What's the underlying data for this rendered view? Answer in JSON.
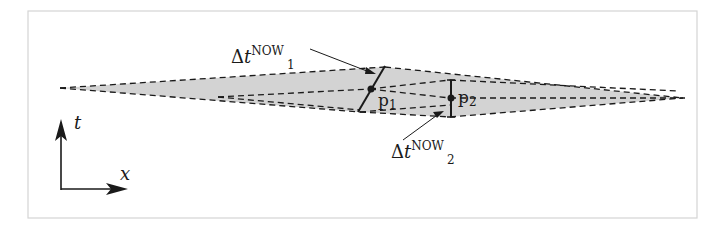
{
  "figure": {
    "frame_color": "#cfcfcf",
    "fill_color": "#d3d3d3",
    "line_color": "#1a1a1a"
  },
  "labels": {
    "dt1": {
      "delta": "Δ",
      "var": "t",
      "sup": "NOW",
      "sub": "1"
    },
    "dt2": {
      "delta": "Δ",
      "var": "t",
      "sup": "NOW",
      "sub": "2"
    },
    "p1": {
      "base": "p",
      "sub": "1"
    },
    "p2": {
      "base": "p",
      "sub": "2"
    }
  },
  "axes": {
    "vertical_label": "t",
    "horizontal_label": "x"
  }
}
